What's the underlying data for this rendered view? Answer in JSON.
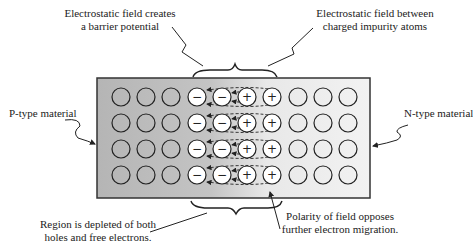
{
  "labels": {
    "barrier_potential": [
      "Electrostatic field  creates",
      "a barrier potential"
    ],
    "impurity_field": [
      "Electrostatic field between",
      "charged impurity atoms"
    ],
    "p_type": "P-type material",
    "n_type": "N-type material",
    "depleted": [
      "Region is depleted of both",
      "holes and free electrons."
    ],
    "polarity": [
      "Polarity of field opposes",
      "further electron migration."
    ]
  },
  "lattice": {
    "rows": 4,
    "columns": [
      "neutral",
      "neutral",
      "neutral",
      "negative-ion",
      "negative-ion",
      "positive-ion",
      "positive-ion",
      "neutral",
      "neutral",
      "neutral"
    ],
    "negative_symbol": "−",
    "positive_symbol": "+"
  },
  "colors": {
    "p_region": "#b8b8b8",
    "n_region": "#efefef",
    "outline": "#333333"
  }
}
